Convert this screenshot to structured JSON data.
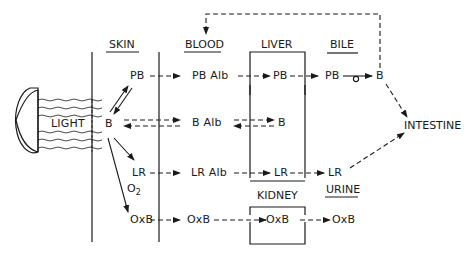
{
  "headers": {
    "skin": "SKIN",
    "blood": "BLOOD",
    "liver": "LIVER",
    "bile": "BILE",
    "kidney": "KIDNEY",
    "urine": "URINE",
    "intestine": "INTESTINE"
  },
  "source": {
    "light": "LIGHT"
  },
  "skin_nodes": {
    "pb": "PB",
    "b": "B",
    "lr": "LR",
    "oxb": "OxB"
  },
  "blood_nodes": {
    "pb_alb": "PB Alb",
    "b_alb": "B Alb",
    "lr_alb": "LR Alb",
    "oxb": "OxB"
  },
  "liver_nodes": {
    "pb": "PB",
    "b": "B",
    "lr": "LR"
  },
  "bile_nodes": {
    "pb": "PB",
    "b": "B",
    "lr": "LR"
  },
  "kidney_nodes": {
    "oxb": "OxB"
  },
  "urine_nodes": {
    "oxb": "OxB"
  },
  "reaction": {
    "o2_main": "O",
    "o2_sub": "2"
  },
  "colors": {
    "ink": "#1a1a1a",
    "background": "#ffffff"
  }
}
